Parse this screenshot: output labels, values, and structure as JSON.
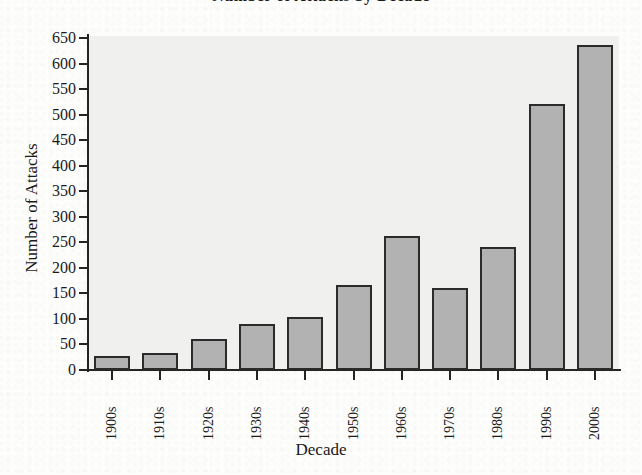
{
  "chart_data": {
    "type": "bar",
    "title": "Number of Attacks by Decade",
    "xlabel": "Decade",
    "ylabel": "Number of Attacks",
    "categories": [
      "1900s",
      "1910s",
      "1920s",
      "1930s",
      "1940s",
      "1950s",
      "1960s",
      "1970s",
      "1980s",
      "1990s",
      "2000s"
    ],
    "values": [
      28,
      33,
      61,
      90,
      104,
      167,
      262,
      161,
      240,
      521,
      637
    ],
    "ylim": [
      0,
      650
    ],
    "ytick_values": [
      0,
      50,
      100,
      150,
      200,
      250,
      300,
      350,
      400,
      450,
      500,
      550,
      600,
      650
    ],
    "ytick_labels": [
      "0",
      "50",
      "100",
      "150",
      "200",
      "250",
      "300",
      "350",
      "400",
      "450",
      "500",
      "550",
      "600",
      "650"
    ],
    "grid": false,
    "legend": null,
    "series": [
      {
        "name": "Number of Attacks",
        "values": [
          28,
          33,
          61,
          90,
          104,
          167,
          262,
          161,
          240,
          521,
          637
        ]
      }
    ]
  },
  "style": {
    "bar_fill": "#b2b2b2",
    "bar_border": "#2b2b2b",
    "plot_background": "#f0f0ee",
    "axis_color": "#242424",
    "text_color": "#1a1a1a",
    "page_background": "#fdfdfc"
  }
}
